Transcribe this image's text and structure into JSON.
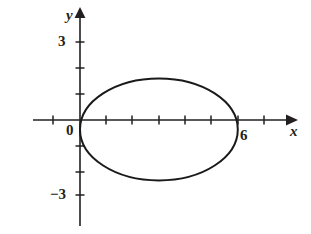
{
  "figure": {
    "width": 311,
    "height": 234,
    "background_color": "#ffffff",
    "ink_color": "#231f20",
    "curve_color": "#1a1a1a"
  },
  "axes": {
    "x_axis_name": "x",
    "y_axis_name": "y",
    "origin_label": "0",
    "origin_px": {
      "x": 80,
      "y": 120
    },
    "unit_px": {
      "x": 26.3,
      "y": 26
    },
    "x_axis_px": {
      "start": 33,
      "end": 292,
      "y": 120
    },
    "y_axis_px": {
      "x": 80,
      "start": 10,
      "end": 226
    },
    "x_tick_values": [
      -2,
      -1,
      1,
      2,
      3,
      4,
      5,
      6,
      7
    ],
    "y_tick_values": [
      3,
      2,
      1,
      -1,
      -2,
      -3
    ],
    "x_tick_labels": [
      {
        "value": 6,
        "text": "6"
      }
    ],
    "y_tick_labels": [
      {
        "value": 3,
        "text": "3"
      },
      {
        "value": -3,
        "text": "−3"
      }
    ],
    "grid": false,
    "legend": "none"
  },
  "chart_data": {
    "type": "line",
    "title": "",
    "subtitle": "",
    "xlabel": "x",
    "ylabel": "y",
    "xlim": [
      -2.4,
      8.1
    ],
    "ylim": [
      -4.2,
      4.3
    ],
    "grid": false,
    "legend_position": "none",
    "curve_kind": "ellipse",
    "annotations": [
      {
        "text": "0",
        "x": -0.5,
        "y": -0.35
      },
      {
        "text": "6",
        "x": 6.2,
        "y": -0.5
      }
    ],
    "series": [
      {
        "name": "ellipse",
        "closed": true,
        "center": {
          "x": 3.0,
          "y": -0.365
        },
        "semi_axis_x": 3.0,
        "semi_axis_y": 1.96,
        "x_intercepts": [
          0,
          6
        ],
        "y_extent": [
          -2.325,
          1.595
        ],
        "points_note": "parametric: x = 3 + 3 cos t, y = -0.365 + 1.96 sin t"
      }
    ]
  },
  "pixel_geometry": {
    "ellipse_center_px": {
      "x": 159,
      "y": 129.5
    },
    "ellipse_rx_px": 79,
    "ellipse_ry_px": 51,
    "x_tick_px": [
      27,
      53,
      106,
      132,
      159,
      185,
      211,
      238,
      264
    ],
    "y_tick_px": [
      42,
      68,
      94,
      146,
      172,
      195
    ],
    "tick_half_len_px": 4
  }
}
